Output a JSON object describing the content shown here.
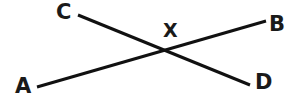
{
  "figure": {
    "background_color": "#ffffff",
    "stroke_color": "#111111",
    "label_color": "#1a1a1a",
    "stroke_width": 3,
    "width": 288,
    "height": 104
  },
  "labels": {
    "a": "A",
    "b": "B",
    "c": "C",
    "d": "D",
    "x": "X"
  },
  "geometry": {
    "lines": [
      {
        "name": "line-ab",
        "from_label": "A",
        "to_label": "B",
        "x1": 37,
        "y1": 87,
        "x2": 266,
        "y2": 21
      },
      {
        "name": "line-cd",
        "from_label": "C",
        "to_label": "D",
        "x1": 78,
        "y1": 15,
        "x2": 250,
        "y2": 85
      }
    ],
    "intersection": {
      "name": "X",
      "x": 170,
      "y": 52
    },
    "label_positions": {
      "a": {
        "x": 15,
        "y": 76
      },
      "b": {
        "x": 269,
        "y": 14
      },
      "c": {
        "x": 56,
        "y": 2
      },
      "d": {
        "x": 255,
        "y": 72
      },
      "x": {
        "x": 163,
        "y": 21
      }
    }
  }
}
